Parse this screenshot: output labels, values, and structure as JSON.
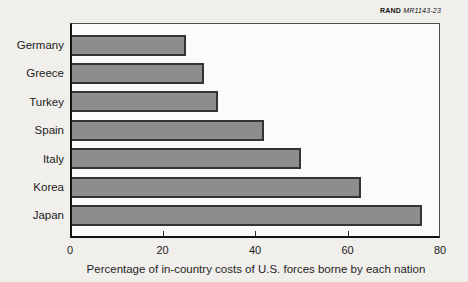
{
  "figure_label": {
    "brand": "RAND",
    "doc_id": "MR1143-23"
  },
  "chart_data": {
    "type": "bar",
    "orientation": "horizontal",
    "title": "",
    "categories": [
      "Germany",
      "Greece",
      "Turkey",
      "Spain",
      "Italy",
      "Korea",
      "Japan"
    ],
    "values": [
      25,
      29,
      32,
      42,
      50,
      63,
      76
    ],
    "xlabel": "Percentage of in-country costs of U.S. forces borne by each nation",
    "ylabel": "",
    "x_ticks": [
      0,
      20,
      40,
      60,
      80
    ],
    "xlim": [
      0,
      80
    ],
    "grid": false,
    "legend_position": "none",
    "bar_color": "#8d8d8d",
    "bar_border_color": "#343434",
    "paper_color": "#f1efec",
    "plot_background_color": "#fcfbf9"
  }
}
